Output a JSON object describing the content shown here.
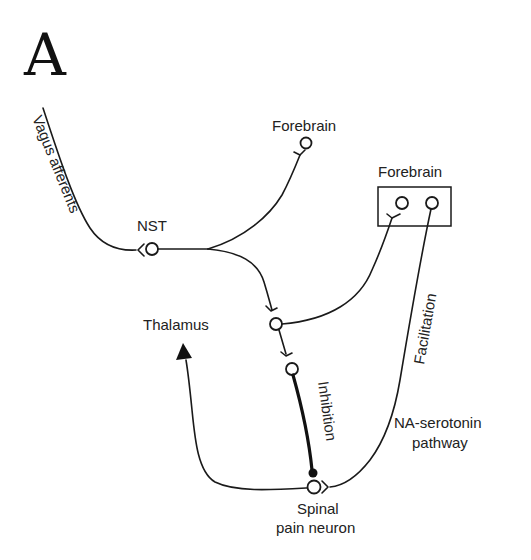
{
  "figure": {
    "panel_label": "A",
    "labels": {
      "vagus": "Vagus afferents",
      "nst": "NST",
      "forebrain_top": "Forebrain",
      "forebrain_box": "Forebrain",
      "thalamus": "Thalamus",
      "inhibition": "Inhibition",
      "facilitation": "Facilitation",
      "na_serotonin_line1": "NA-serotonin",
      "na_serotonin_line2": "pathway",
      "spinal_line1": "Spinal",
      "spinal_line2": "pain neuron"
    },
    "nodes": [
      {
        "id": "nst",
        "label": "NST"
      },
      {
        "id": "forebrain-top",
        "label": "Forebrain"
      },
      {
        "id": "forebrain-box-left",
        "label": "Forebrain"
      },
      {
        "id": "forebrain-box-right",
        "label": "Forebrain"
      },
      {
        "id": "relay-upper"
      },
      {
        "id": "relay-lower"
      },
      {
        "id": "spinal-pain-neuron",
        "label": "Spinal pain neuron"
      },
      {
        "id": "thalamus",
        "label": "Thalamus"
      }
    ],
    "edges": [
      {
        "from": "vagus-afferents",
        "to": "nst",
        "type": "excitatory synapse"
      },
      {
        "from": "nst",
        "to": "forebrain-top",
        "type": "excitatory synapse"
      },
      {
        "from": "nst",
        "to": "relay-upper",
        "type": "excitatory synapse"
      },
      {
        "from": "relay-upper",
        "to": "forebrain-box-left",
        "type": "excitatory synapse"
      },
      {
        "from": "relay-upper",
        "to": "relay-lower",
        "type": "excitatory synapse"
      },
      {
        "from": "relay-lower",
        "to": "spinal-pain-neuron",
        "type": "inhibition"
      },
      {
        "from": "forebrain-box-right",
        "to": "spinal-pain-neuron",
        "type": "facilitation (NA-serotonin pathway)"
      },
      {
        "from": "spinal-pain-neuron",
        "to": "thalamus",
        "type": "projection arrow"
      }
    ],
    "colors": {
      "ink": "#1a1a1a",
      "background": "#ffffff"
    }
  }
}
